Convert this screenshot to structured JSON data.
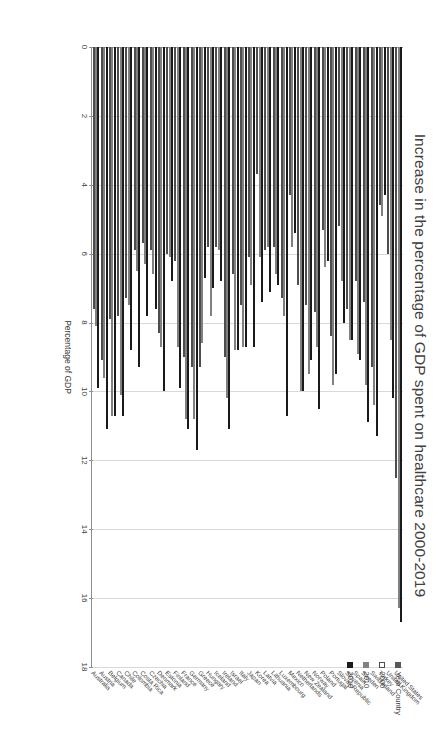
{
  "chart_data": {
    "type": "bar",
    "orientation": "horizontal",
    "title": "Increase in the percentage of GDP spent on healthcare 2000-2019",
    "xlabel": "Percentage of GDP",
    "ylabel": "",
    "xlim": [
      0,
      18
    ],
    "xticks": [
      0,
      2,
      4,
      6,
      8,
      10,
      12,
      14,
      16,
      18
    ],
    "grid": true,
    "legend_position": "right",
    "legend_header": "Year Country",
    "series": [
      {
        "name": "2000",
        "color": "#ffffff",
        "values": [
          12.5,
          6.0,
          4.6,
          9.3,
          7.4,
          6.8,
          7.6,
          5.2,
          8.4,
          5.3,
          7.7,
          7.5,
          6.9,
          4.3,
          7.3,
          5.8,
          5.9,
          3.7,
          6.1,
          7.5,
          6.6,
          9.0,
          5.8,
          5.8,
          9.3,
          9.3,
          9.0,
          6.2,
          6.0,
          8.3,
          5.9,
          5.7,
          5.9,
          7.3,
          7.8,
          7.9,
          9.1,
          7.6
        ]
      },
      {
        "name": "2010",
        "color": "#808080",
        "values": [
          16.3,
          8.5,
          4.9,
          10.4,
          9.8,
          8.9,
          8.5,
          6.8,
          9.8,
          6.4,
          8.7,
          9.5,
          10.0,
          5.8,
          7.8,
          6.6,
          5.8,
          6.1,
          6.9,
          8.7,
          8.8,
          10.2,
          5.9,
          7.8,
          8.6,
          10.8,
          10.8,
          8.7,
          6.1,
          8.7,
          6.6,
          6.3,
          6.5,
          7.5,
          10.1,
          10.7,
          9.6,
          8.1
        ]
      },
      {
        "name": "2019",
        "color": "#1a1a1a",
        "values": [
          16.7,
          10.2,
          4.3,
          11.3,
          10.9,
          9.1,
          8.5,
          8.0,
          9.5,
          6.2,
          10.5,
          9.1,
          10.0,
          5.4,
          10.7,
          6.9,
          7.1,
          7.4,
          8.7,
          8.7,
          8.8,
          11.1,
          6.8,
          7.0,
          6.7,
          11.7,
          11.1,
          9.9,
          6.8,
          10.0,
          7.6,
          7.8,
          9.3,
          8.8,
          10.7,
          10.7,
          11.1,
          9.9
        ]
      }
    ],
    "categories": [
      "United States",
      "United Kingdom",
      "Turkey",
      "Switzerland",
      "Sweden",
      "Spain",
      "Slovenia",
      "Slovak Republic",
      "Portugal",
      "Poland",
      "Norway",
      "New Zealand",
      "Netherlands",
      "Mexico",
      "Luxembourg",
      "Lithuania",
      "Latvia",
      "Korea",
      "Japan",
      "Italy",
      "Israel",
      "Ireland",
      "Iceland",
      "Hungary",
      "Greece",
      "Germany",
      "France",
      "Finland",
      "Estonia",
      "Denmark",
      "Czechia",
      "Costa Rica",
      "Colombia",
      "Chile",
      "Canada",
      "Belgium",
      "Austria",
      "Australia"
    ]
  },
  "legend": {
    "items": [
      {
        "label": "Year Country",
        "swatch": "s-head"
      },
      {
        "label": "2000",
        "swatch": "s-2000"
      },
      {
        "label": "2010",
        "swatch": "s-2010"
      },
      {
        "label": "2019",
        "swatch": "s-2019"
      }
    ]
  }
}
